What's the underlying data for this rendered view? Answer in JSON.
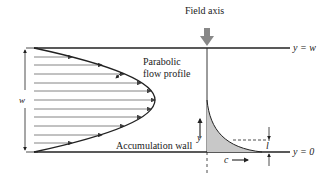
{
  "labels": {
    "field_axis": "Field axis",
    "parabolic_1": "Parabolic",
    "parabolic_2": "flow profile",
    "accumulation_wall": "Accumulation wall",
    "y_eq_w": "y = w",
    "y_eq_0": "y = 0",
    "w": "w",
    "y": "y",
    "c": "c",
    "l": "l"
  },
  "colors": {
    "line": "#222222",
    "fill": "#c8c8c8",
    "arrow_gray": "#777777"
  }
}
